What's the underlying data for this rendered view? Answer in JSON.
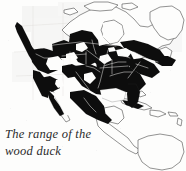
{
  "figure": {
    "kind": "range-map-figure",
    "caption_line_1": "The range of the",
    "caption_line_2": "wood duck",
    "caption_full": "The range of the wood duck",
    "background_color": "#fdfdfc",
    "range_fill_color": "#111111",
    "coastline_color": "#4a4a4a",
    "river_color": "#f4f3f0",
    "width_px": 186,
    "height_px": 171
  },
  "map_data": {
    "type": "range-map",
    "subject": "wood duck",
    "region": "North America",
    "legend_note": "Shaded (dark) areas indicate the range of the wood duck",
    "shading_levels": [
      {
        "name": "range",
        "color": "#111111"
      },
      {
        "name": "outside-range",
        "color": "#fdfdfc"
      }
    ],
    "landmasses_outlined": [
      "Alaska",
      "Canada",
      "Greenland",
      "United States",
      "Mexico",
      "Central America",
      "Caribbean islands",
      "northern South America"
    ],
    "range_areas_shaded": [
      "Pacific Northwest coast",
      "British Columbia coast",
      "Alaska panhandle",
      "California valleys",
      "Rocky Mountain interior patches",
      "Great Plains",
      "Midwest",
      "Great Lakes region",
      "southern Ontario and Quebec",
      "Atlantic seaboard",
      "Southeast United States",
      "Florida peninsula",
      "Gulf Coast",
      "eastern Mexico",
      "Baja California",
      "Cuba"
    ],
    "unshaded_features": [
      "Hudson Bay",
      "Great Lakes",
      "Great Basin desert",
      "northern Canada tundra",
      "Greenland",
      "Arctic islands",
      "Central America",
      "South America"
    ]
  }
}
